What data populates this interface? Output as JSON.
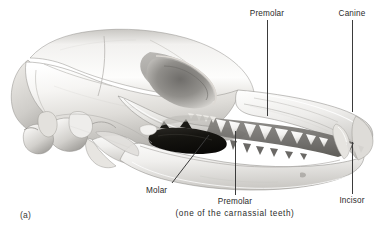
{
  "figure": {
    "panel_letter": "(a)",
    "background_color": "#ffffff",
    "line_color": "#3b3b3b",
    "text_color": "#2b2b2b"
  },
  "labels": {
    "premolar_top": "Premolar",
    "canine": "Canine",
    "incisor": "Incisor",
    "molar": "Molar",
    "premolar_bottom": "Premolar",
    "premolar_bottom_sub": "(one of the carnassial teeth)"
  },
  "palette": {
    "bone_light": "#f4f3f1",
    "bone_mid": "#d8d6d2",
    "bone_shadow": "#a8a6a2",
    "bone_deep": "#7d7b78",
    "tooth_white": "#fbfbfa",
    "gum_dark": "#6e6c69",
    "carnassial_black": "#14130f",
    "outline": "#5a5855"
  }
}
